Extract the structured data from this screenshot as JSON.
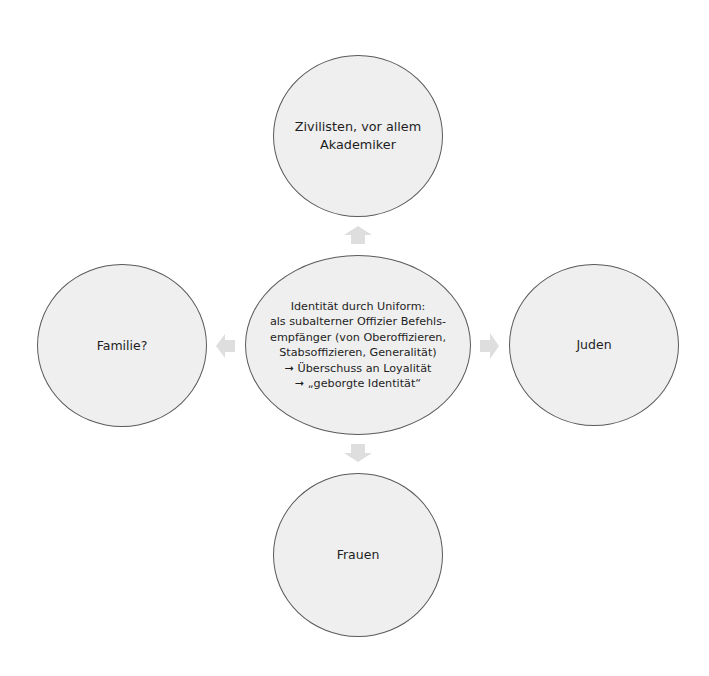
{
  "colors": {
    "node_fill": "#efefef",
    "node_border": "#5a5a5a",
    "arrow_fill": "#dedede",
    "text": "#1e1e1e",
    "background": "#ffffff"
  },
  "diagram": {
    "center": {
      "lines": [
        "Identität durch Uniform:",
        "als subalterner Offizier Befehls-",
        "empfänger (von Oberoffizieren,",
        "Stabsoffizieren, Generalität)",
        "➞ Überschuss an Loyalität",
        "➞ „geborgte Identität“"
      ]
    },
    "top": {
      "lines": [
        "Zivilisten, vor allem",
        "Akademiker"
      ]
    },
    "left": {
      "lines": [
        "Familie?"
      ]
    },
    "right": {
      "lines": [
        "Juden"
      ]
    },
    "bottom": {
      "lines": [
        "Frauen"
      ]
    },
    "arrows": [
      {
        "direction": "up",
        "icon": "arrow-up-icon"
      },
      {
        "direction": "left",
        "icon": "arrow-left-icon"
      },
      {
        "direction": "right",
        "icon": "arrow-right-icon"
      },
      {
        "direction": "down",
        "icon": "arrow-down-icon"
      }
    ]
  }
}
